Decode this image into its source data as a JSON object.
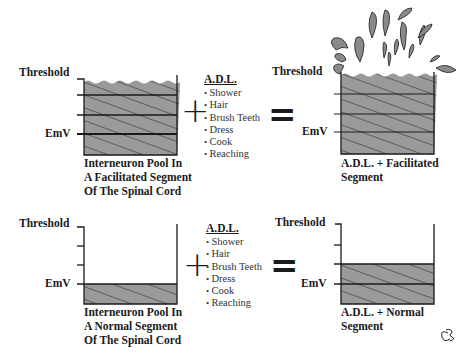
{
  "diagram": {
    "top_row": {
      "left_panel": {
        "threshold_label": "Threshold",
        "emv_label": "EmV",
        "caption": [
          "Interneuron Pool In",
          "A Facilitated Segment",
          "Of The Spinal Cord"
        ]
      },
      "operator_plus": "+",
      "adl": {
        "title": "A.D.L.",
        "items": [
          "Shower",
          "Hair",
          "Brush Teeth",
          "Dress",
          "Cook",
          "Reaching"
        ]
      },
      "operator_equals": "=",
      "right_panel": {
        "threshold_label": "Threshold",
        "emv_label": "EmV",
        "caption": [
          "A.D.L. + Facilitated",
          "Segment"
        ]
      }
    },
    "bottom_row": {
      "left_panel": {
        "threshold_label": "Threshold",
        "emv_label": "EmV",
        "caption": [
          "Interneuron Pool In",
          "A Normal Segment",
          "Of The Spinal Cord"
        ]
      },
      "operator_plus": "+",
      "adl": {
        "title": "A.D.L.",
        "items": [
          "Shower",
          "Hair",
          "Brush Teeth",
          "Dress",
          "Cook",
          "Reaching"
        ]
      },
      "operator_equals": "=",
      "right_panel": {
        "threshold_label": "Threshold",
        "emv_label": "EmV",
        "caption": [
          "A.D.L. + Normal",
          "Segment"
        ]
      }
    },
    "signature": "CB",
    "colors": {
      "fill": "#9a9a9a",
      "line": "#1a1a1a"
    }
  }
}
